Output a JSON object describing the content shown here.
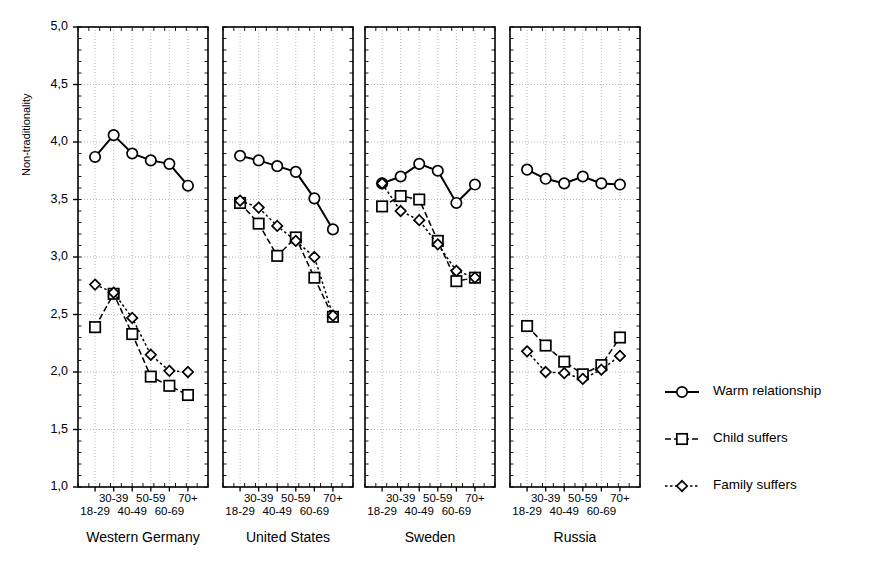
{
  "chart_data": {
    "type": "line",
    "title": "",
    "ylabel": "Non-traditionality",
    "xlabel": "",
    "ylim": [
      1.0,
      5.0
    ],
    "ytick_labels": [
      "1,0",
      "1,5",
      "2,0",
      "2,5",
      "3,0",
      "3,5",
      "4,0",
      "4,5",
      "5,0"
    ],
    "ytick_values": [
      1.0,
      1.5,
      2.0,
      2.5,
      3.0,
      3.5,
      4.0,
      4.5,
      5.0
    ],
    "grid": true,
    "grid_style": "dotted",
    "legend_position": "right",
    "categories": [
      "18-29",
      "30-39",
      "40-49",
      "50-59",
      "60-69",
      "70+"
    ],
    "panels": [
      {
        "name": "Western Germany",
        "series": [
          {
            "name": "Warm relationship",
            "values": [
              3.87,
              4.06,
              3.9,
              3.84,
              3.81,
              3.62
            ]
          },
          {
            "name": "Child suffers",
            "values": [
              2.39,
              2.68,
              2.33,
              1.96,
              1.88,
              1.8
            ]
          },
          {
            "name": "Family suffers",
            "values": [
              2.76,
              2.69,
              2.47,
              2.15,
              2.01,
              2.0
            ]
          }
        ]
      },
      {
        "name": "United States",
        "series": [
          {
            "name": "Warm relationship",
            "values": [
              3.88,
              3.84,
              3.79,
              3.74,
              3.51,
              3.24
            ]
          },
          {
            "name": "Child suffers",
            "values": [
              3.47,
              3.29,
              3.01,
              3.17,
              2.82,
              2.48
            ]
          },
          {
            "name": "Family suffers",
            "values": [
              3.49,
              3.43,
              3.27,
              3.14,
              3.0,
              2.49
            ]
          }
        ]
      },
      {
        "name": "Sweden",
        "series": [
          {
            "name": "Warm relationship",
            "values": [
              3.64,
              3.7,
              3.81,
              3.75,
              3.47,
              3.63
            ]
          },
          {
            "name": "Child suffers",
            "values": [
              3.44,
              3.53,
              3.5,
              3.14,
              2.79,
              2.82
            ]
          },
          {
            "name": "Family suffers",
            "values": [
              3.64,
              3.4,
              3.32,
              3.11,
              2.88,
              2.82
            ]
          }
        ]
      },
      {
        "name": "Russia",
        "series": [
          {
            "name": "Warm relationship",
            "values": [
              3.76,
              3.68,
              3.64,
              3.7,
              3.64,
              3.63
            ]
          },
          {
            "name": "Child suffers",
            "values": [
              2.4,
              2.23,
              2.09,
              1.98,
              2.06,
              2.3
            ]
          },
          {
            "name": "Family suffers",
            "values": [
              2.18,
              2.0,
              1.99,
              1.94,
              2.02,
              2.14
            ]
          }
        ]
      }
    ],
    "legend": [
      {
        "label": "Warm relationship",
        "marker": "circle",
        "line": "solid"
      },
      {
        "label": "Child suffers",
        "marker": "square",
        "line": "dashed"
      },
      {
        "label": "Family suffers",
        "marker": "diamond",
        "line": "dotted"
      }
    ]
  }
}
